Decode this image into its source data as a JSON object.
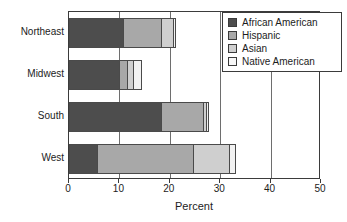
{
  "chart_data": {
    "type": "bar",
    "orientation": "horizontal",
    "stacked": true,
    "title": "",
    "xlabel": "Percent",
    "ylabel": "",
    "xlim": [
      0,
      50
    ],
    "xticks": [
      0,
      10,
      20,
      30,
      40,
      50
    ],
    "xtick_labels": [
      "0",
      "10",
      "20",
      "30",
      "40",
      "50"
    ],
    "grid": true,
    "grid_axis": "x",
    "legend_position": "top-right",
    "categories": [
      "Northeast",
      "Midwest",
      "South",
      "West"
    ],
    "series": [
      {
        "name": "African American",
        "color": "#4d4d4d",
        "values": [
          10.9,
          10.2,
          18.5,
          5.8
        ]
      },
      {
        "name": "Hispanic",
        "color": "#a8a8a8",
        "values": [
          7.7,
          1.8,
          8.5,
          19.2
        ]
      },
      {
        "name": "Asian",
        "color": "#cfcfcf",
        "values": [
          2.6,
          1.3,
          0.7,
          7.3
        ]
      },
      {
        "name": "Native American",
        "color": "#f2f2f2",
        "values": [
          0.6,
          1.7,
          0.7,
          1.4
        ]
      }
    ],
    "totals": [
      21.8,
      15.0,
      28.4,
      33.7
    ]
  },
  "legend": {
    "items": [
      {
        "label": "African American",
        "swatch": "legend-swatch-african-american"
      },
      {
        "label": "Hispanic",
        "swatch": "legend-swatch-hispanic"
      },
      {
        "label": "Asian",
        "swatch": "legend-swatch-asian"
      },
      {
        "label": "Native American",
        "swatch": "legend-swatch-native-american"
      }
    ]
  },
  "colors": {
    "african_american": "#4d4d4d",
    "hispanic": "#a8a8a8",
    "asian": "#cfcfcf",
    "native_american": "#f2f2f2",
    "frame": "#3b3b3b",
    "gridline": "#6e6e6e",
    "text": "#1c1c1c",
    "background": "#ffffff"
  }
}
